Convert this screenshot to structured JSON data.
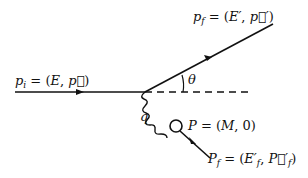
{
  "diagram": {
    "type": "scattering-process",
    "labels": {
      "incoming": {
        "sym": "p",
        "sub": "i",
        "eq": " = (",
        "e": "E",
        "mid": ", ",
        "vec": "p⃗",
        "end": ")"
      },
      "outgoing": {
        "sym": "p",
        "sub": "f",
        "eq": " = (",
        "e": "E′",
        "mid": ", ",
        "vec": "p⃗′",
        "end": ")"
      },
      "angle": "θ",
      "exchange": "q",
      "target": {
        "sym": "P",
        "eq": " = (",
        "e": "M",
        "mid": ", 0)"
      },
      "target_final": {
        "sym": "P",
        "sub": "f",
        "eq": " = (",
        "e": "E′",
        "esub": "f",
        "mid": ", ",
        "vec": "P⃗′",
        "vsub": "f",
        "end": ")"
      }
    },
    "colors": {
      "line": "#111111",
      "background": "#ffffff"
    }
  }
}
